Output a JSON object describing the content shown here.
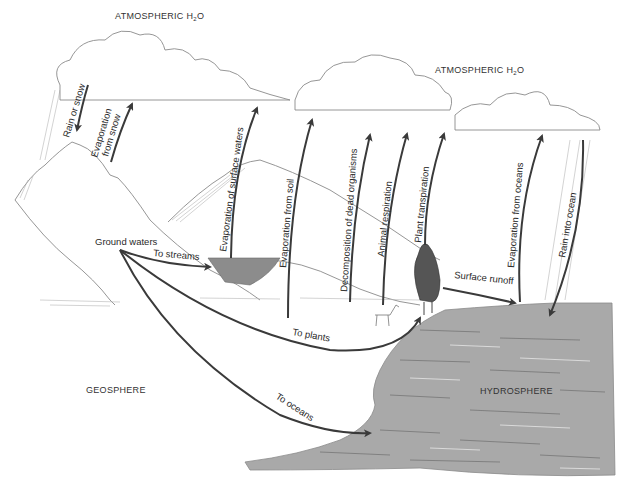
{
  "diagram": {
    "title_left": "ATMOSPHERIC H",
    "title_right": "ATMOSPHERIC H",
    "subscript": "2",
    "title_suffix": "O",
    "regions": {
      "geosphere": "GEOSPHERE",
      "hydrosphere": "HYDROSPHERE"
    },
    "flows": {
      "rain_or_snow": "Rain or snow",
      "evap_snow_1": "Evaporation",
      "evap_snow_2": "from snow",
      "evap_surface": "Evaporation of surface waters",
      "evap_soil": "Evaporation from soil",
      "decomposition": "Decomposition of dead organisms",
      "animal_resp": "Animal respiration",
      "plant_transp": "Plant transpiration",
      "evap_oceans": "Evaporation from oceans",
      "rain_ocean": "Rain into ocean",
      "ground_waters": "Ground waters",
      "to_streams": "To streams",
      "surface_runoff": "Surface runoff",
      "to_plants": "To plants",
      "to_oceans": "To oceans"
    },
    "colors": {
      "ocean": "#a9a9a9",
      "arrow": "#3a3a3a",
      "sketch": "#8a8a8a",
      "text": "#2a2a2a"
    }
  }
}
